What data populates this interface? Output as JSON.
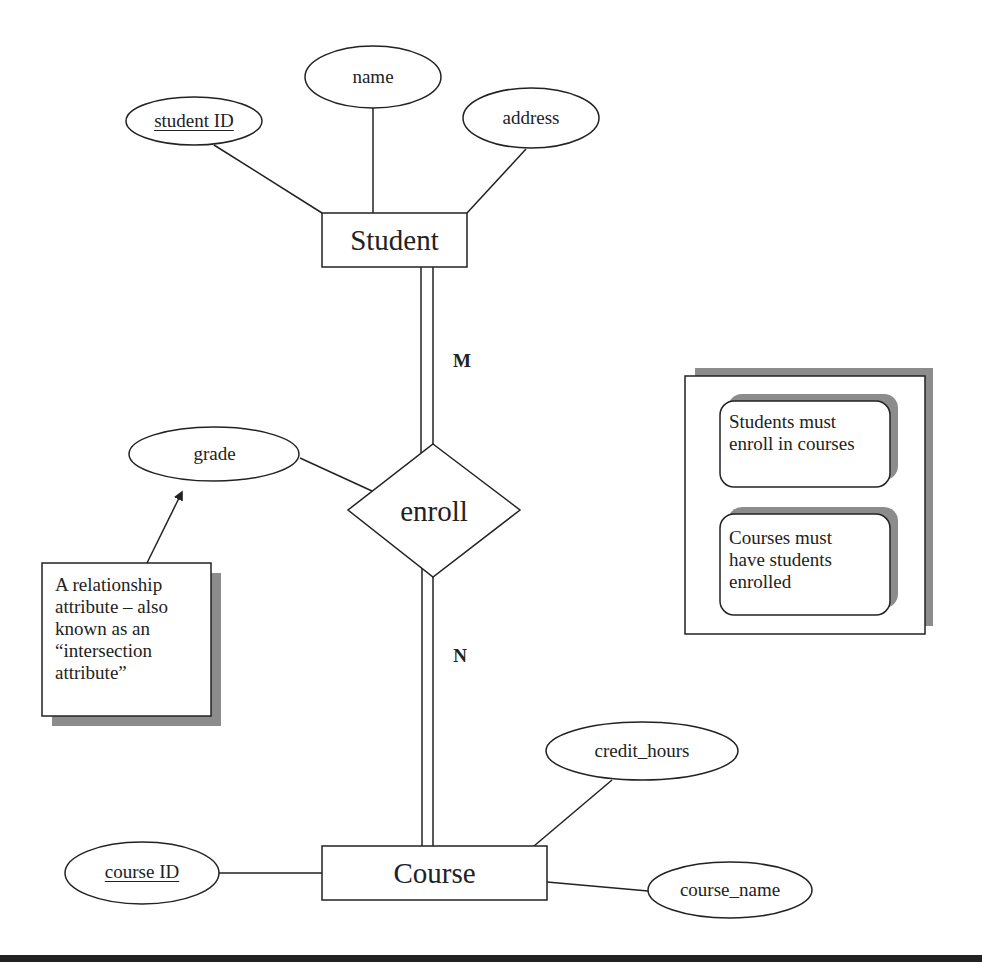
{
  "diagram": {
    "type": "entity-relationship",
    "entities": [
      {
        "id": "student",
        "label": "Student"
      },
      {
        "id": "course",
        "label": "Course"
      }
    ],
    "relationship": {
      "id": "enroll",
      "label": "enroll"
    },
    "attributes": {
      "student_id": {
        "label": "student ID",
        "key": true,
        "owner": "Student"
      },
      "name": {
        "label": "name",
        "key": false,
        "owner": "Student"
      },
      "address": {
        "label": "address",
        "key": false,
        "owner": "Student"
      },
      "grade": {
        "label": "grade",
        "key": false,
        "owner": "enroll"
      },
      "course_id": {
        "label": "course ID",
        "key": true,
        "owner": "Course"
      },
      "credit_hours": {
        "label": "credit_hours",
        "key": false,
        "owner": "Course"
      },
      "course_name": {
        "label": "course_name",
        "key": false,
        "owner": "Course"
      }
    },
    "cardinality": {
      "student_side": "M",
      "course_side": "N"
    },
    "participation": {
      "student_side": "total",
      "course_side": "total"
    },
    "annotation": {
      "text": "A relationship attribute – also known as an “intersection attribute”",
      "lines": [
        "A relationship",
        "attribute – also",
        "known as an",
        "“intersection",
        "attribute”"
      ],
      "points_to": "grade"
    },
    "legend": {
      "items": [
        {
          "lines": [
            "Students must",
            "enroll in courses"
          ]
        },
        {
          "lines": [
            "Courses must",
            "have students",
            "enrolled"
          ]
        }
      ]
    },
    "colors": {
      "stroke": "#222222",
      "shadow": "#8c8c8c",
      "background": "#ffffff"
    }
  }
}
